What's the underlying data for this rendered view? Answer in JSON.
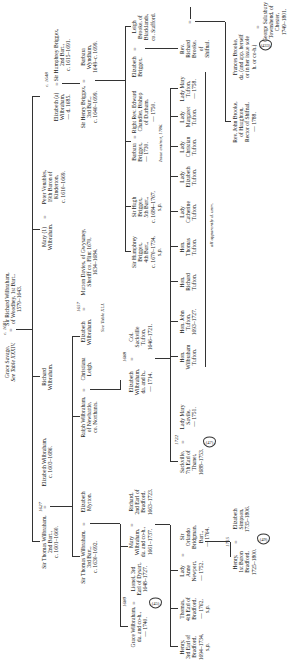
{
  "chart": {
    "orientation": "rotated 90° counter-clockwise",
    "generation_1": {
      "grace_savage": {
        "name": "Grace Savage,",
        "note": "See Table XXXIV."
      },
      "marriage_date": "c. 1601",
      "sir_richard": {
        "name": "Sir Richard Wilbraham,",
        "line2": "of Woodhey, 1st Bart.,",
        "dates": "1579–1643."
      }
    },
    "generation_2": [
      {
        "name": "Sir Thomas Wilbraham,",
        "line2": "2nd Bart.,",
        "dates": "c. 1601–1660.",
        "marriage_date": "1627",
        "spouse": "Elizabeth Wilbraham,",
        "spouse_dates": "c. 1603–1686."
      },
      {
        "name": "Richard",
        "line2": "Wilbraham."
      },
      {
        "name": "Mary",
        "line2": "Wilbraham.",
        "marker": "(1)",
        "spouse": "Peter Venables,",
        "spouse_line2": "19th Baron of",
        "spouse_line3": "Kinderton,",
        "spouse_dates": "c. 1610–1669."
      },
      {
        "name": "Elizabeth (a)",
        "line2": "Wilbraham,",
        "dates": "— d. 1685.",
        "marriage_date": "c. 1648",
        "spouse": "Sir Humphrey Briggex,",
        "spouse_line2": "2nd Bart.,",
        "spouse_dates": "c. 1615–1691."
      }
    ],
    "generation_3": [
      {
        "name": "Sir Thomas Wilbraham,",
        "line2": "3rd Bart.,",
        "dates": "c. 1630–1692.",
        "spouse": "Elizabeth",
        "spouse_line2": "Mytton."
      },
      {
        "name": "Ralph Wilbraham,",
        "line2": "of Newbattle,",
        "line3": "co. Northants.",
        "spouse": "Christiana",
        "spouse_line2": "Leigh."
      },
      {
        "name": "Elizabeth",
        "line2": "Wilbraham.",
        "marriage_date": "1657",
        "spouse": "Mutton Davies, of Gwysaney,",
        "spouse_line2": "Sheriff co. Flint 1670,",
        "spouse_dates": "1634–1684.",
        "note": "See Table XLI."
      },
      {
        "name": "Sir Henry Briggex,",
        "line2": "3rd Bart.,",
        "dates": "c. 1640–1699.",
        "spouse": "Barbara",
        "spouse_line2": "Wyndham,",
        "spouse_dates": "1649–c. 1699."
      }
    ],
    "generation_4": [
      {
        "name": "Grace Wilbraham,",
        "line2": "da. and co-h.,",
        "dates": "— 1740.",
        "marriage_date": "1680",
        "spouse": "Lionel, 3rd",
        "spouse_line2": "Earl of Dysart,",
        "spouse_dates": "1648–1727.",
        "ref": "(45)"
      },
      {
        "name": "Mary",
        "line2": "Wilbraham,",
        "line3": "da. and co-h.,",
        "dates": "1661–1737.",
        "spouse": "Richard,",
        "spouse_line2": "2nd Earl of",
        "spouse_line3": "Bradford,",
        "spouse_dates": "1663–1723."
      },
      {
        "name": "Elizabeth",
        "line2": "Wilbraham,",
        "line3": "da. and h.,",
        "dates": "— 1714.",
        "marriage_date": "1688",
        "spouse": "Col.",
        "spouse_line2": "Sackville",
        "spouse_line3": "Tufton,",
        "spouse_dates": "1646–1721."
      },
      {
        "name": "Sir Humphrey",
        "line2": "Briggex,",
        "line3": "4th Bart.,",
        "dates": "c. 1670–1734,",
        "note": "s.p."
      },
      {
        "name": "Sir Hugh",
        "line2": "Briggex,",
        "line3": "5th Bart.,",
        "dates": "c. 1684–1767,",
        "note": "s.p."
      },
      {
        "name": "Barbara",
        "line2": "Briggex,",
        "dates": "— 1730.",
        "spouse": "Right Rev. Edward",
        "spouse_line2": "Chandler, Bishop",
        "spouse_line3": "of Durham,",
        "spouse_dates": "— 1750.",
        "issue_note": "Issue extinct, 1786."
      },
      {
        "name": "Elizabeth",
        "line2": "Briggex.",
        "spouse": "Leigh",
        "spouse_line2": "Brooke, of",
        "spouse_line3": "Blacklands,",
        "spouse_line4": "co. Stafford."
      }
    ],
    "generation_5": [
      {
        "name": "Henry,",
        "line2": "3rd Earl of",
        "line3": "Bradford,",
        "dates": "1694–1734,",
        "note": "s.p."
      },
      {
        "name": "Thomas,",
        "line2": "4th Earl of",
        "line3": "Bradford,",
        "dates": "— 1762,",
        "note": "s.p."
      },
      {
        "name": "Lady",
        "line2": "Anne",
        "line3": "Newport,",
        "dates": "— 1752.",
        "spouse": "Sir",
        "spouse_line2": "Orlando",
        "spouse_line3": "Bridgman,",
        "spouse_line4": "Bart.,",
        "spouse_dates": "— 1764."
      },
      {
        "name": "Sackville,",
        "line2": "7th Earl of",
        "line3": "Thanet,",
        "dates": "1688–1753.",
        "marriage_date": "1722",
        "spouse": "Lady Mary",
        "spouse_line2": "Savile,",
        "spouse_dates": "— 1751.",
        "ref": "(47)"
      },
      {
        "name": "Hon.",
        "line2": "Wilbraham",
        "line3": "Tufton."
      },
      {
        "name": "Hon. John",
        "line2": "Tufton,",
        "dates": "1693–1727."
      },
      {
        "name": "Hon.",
        "line2": "Richard",
        "line3": "Tufton."
      },
      {
        "name": "Hon.",
        "line2": "Thomas",
        "line3": "Tufton."
      },
      {
        "name": "Lady",
        "line2": "Catherine",
        "line3": "Tufton."
      },
      {
        "name": "Lady",
        "line2": "Elizabeth",
        "line3": "Tufton."
      },
      {
        "name": "Lady",
        "line2": "Christian",
        "line3": "Tufton."
      },
      {
        "name": "Lady",
        "line2": "Margaret",
        "line3": "Tufton."
      },
      {
        "name": "Lady Mary",
        "line2": "Tufton,",
        "dates": "— 1758."
      },
      {
        "name": "Rev.",
        "line2": "Richard",
        "line3": "Brooke,",
        "line4": "of",
        "line5": "Shifnal."
      }
    ],
    "tufton_group_note": "all apparently d. unm.",
    "generation_6": [
      {
        "name": "Henry,",
        "line2": "1st Baron",
        "line3": "Bradford,",
        "dates": "1725–1800.",
        "marriage_date": "1755",
        "spouse": "Elizabeth",
        "spouse_line2": "Simpson,",
        "spouse_dates": "1735–1806.",
        "ref": "(49)"
      },
      {
        "name": "Rev. John Brooke,",
        "line2": "of Haughton,",
        "line3": "Rector of Shifnal,",
        "dates": "— 1788."
      },
      {
        "name": "Frances Brooke,",
        "line2": "da. (and app. herself",
        "line3": "or in her issue sole",
        "line4": "h. or co-h.)",
        "spouse": "George Salusbury",
        "spouse_line2": "Townshend, of",
        "spouse_line3": "Chester,",
        "spouse_dates": "1749–1801.",
        "ref": "(433)"
      }
    ],
    "colors": {
      "ink": "#1a1a1a",
      "paper": "#ffffff",
      "lines": "#333333"
    }
  }
}
